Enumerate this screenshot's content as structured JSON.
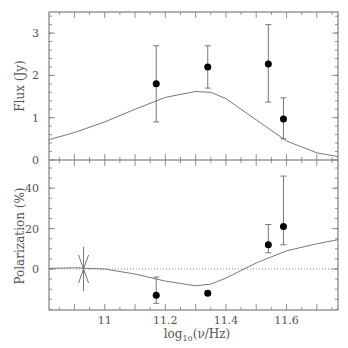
{
  "chart_data": [
    {
      "type": "scatter",
      "panel": "top",
      "title": "",
      "xlabel": "",
      "ylabel": "Flux (Jy)",
      "xlim": [
        10.816,
        11.77
      ],
      "ylim": [
        0,
        3.5
      ],
      "yticks": [
        0,
        1,
        2,
        3
      ],
      "grid": false,
      "points": [
        {
          "x": 11.17,
          "y": 1.8,
          "err_low": 0.9,
          "err_high": 2.7
        },
        {
          "x": 11.34,
          "y": 2.2,
          "err_low": 1.7,
          "err_high": 2.7
        },
        {
          "x": 11.54,
          "y": 2.27,
          "err_low": 1.37,
          "err_high": 3.2
        },
        {
          "x": 11.59,
          "y": 0.97,
          "err_low": 0.5,
          "err_high": 1.47
        }
      ],
      "model_curve": {
        "x": [
          10.816,
          10.9,
          11.0,
          11.1,
          11.2,
          11.3,
          11.35,
          11.4,
          11.5,
          11.6,
          11.7,
          11.77
        ],
        "y": [
          0.48,
          0.65,
          0.9,
          1.2,
          1.48,
          1.62,
          1.6,
          1.45,
          0.95,
          0.45,
          0.17,
          0.08
        ]
      }
    },
    {
      "type": "scatter",
      "panel": "bottom",
      "title": "",
      "xlabel": "log10(ν/Hz)",
      "ylabel": "Polarization (%)",
      "xlim": [
        10.816,
        11.77
      ],
      "ylim": [
        -20,
        54
      ],
      "yticks": [
        0,
        20,
        40
      ],
      "xticks": [
        11,
        11.2,
        11.4,
        11.6
      ],
      "grid": false,
      "reference_line": {
        "y": 0,
        "style": "dotted"
      },
      "points": [
        {
          "x": 11.17,
          "y": -13,
          "err_low": -17,
          "err_high": -4
        },
        {
          "x": 11.34,
          "y": -12,
          "err_low": -13,
          "err_high": -11
        },
        {
          "x": 11.54,
          "y": 12,
          "err_low": 8,
          "err_high": 22
        },
        {
          "x": 11.59,
          "y": 21,
          "err_low": 12,
          "err_high": 46
        }
      ],
      "star_marker": {
        "x": 10.93,
        "y": 0,
        "err_low": -11,
        "err_high": 11
      },
      "model_curve": {
        "x": [
          10.816,
          10.9,
          11.0,
          11.1,
          11.2,
          11.3,
          11.35,
          11.4,
          11.5,
          11.6,
          11.7,
          11.77
        ],
        "y": [
          0.3,
          0.6,
          0,
          -2.5,
          -6,
          -8.3,
          -7.5,
          -4.5,
          3,
          9,
          12.5,
          14.5
        ]
      }
    }
  ],
  "labels": {
    "top_ylabel": "Flux (Jy)",
    "bottom_ylabel": "Polarization (%)",
    "xlabel_prefix": "log",
    "xlabel_sub": "10",
    "xlabel_suffix": "(ν/Hz)",
    "top_yticks": [
      "0",
      "1",
      "2",
      "3"
    ],
    "bottom_yticks": [
      "0",
      "20",
      "40"
    ],
    "xticks": [
      "11",
      "11.2",
      "11.4",
      "11.6"
    ]
  }
}
